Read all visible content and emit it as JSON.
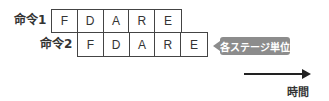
{
  "instructions": [
    {
      "label": "命令1",
      "stages": [
        "F",
        "D",
        "A",
        "R",
        "E"
      ]
    },
    {
      "label": "命令2",
      "stages": [
        "F",
        "D",
        "A",
        "R",
        "E"
      ]
    }
  ],
  "callout": {
    "text": "各ステージ単位"
  },
  "axis": {
    "label": "時間"
  },
  "colors": {
    "callout_bg": "#8c8c8c",
    "border": "#444444",
    "arrow": "#222222"
  }
}
